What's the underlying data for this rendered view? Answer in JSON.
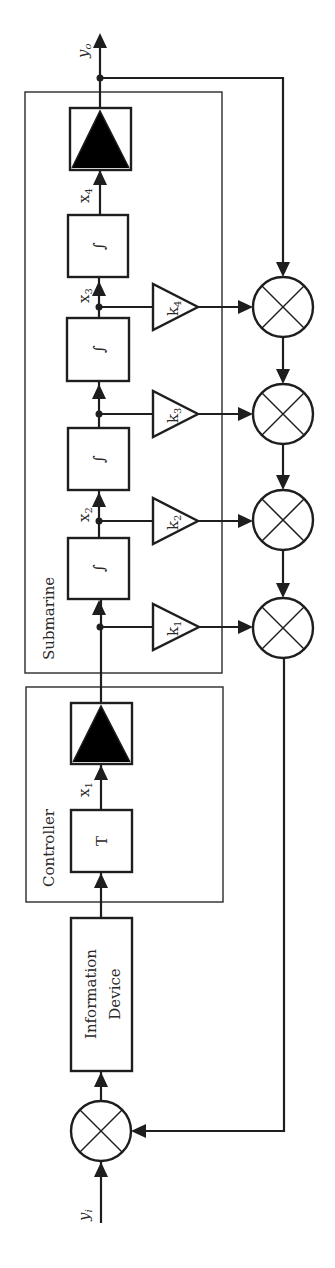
{
  "diagram": {
    "orientation": "rotated-90-ccw",
    "signals": {
      "input": {
        "base": "y",
        "sub": "i"
      },
      "output": {
        "base": "y",
        "sub": "o"
      },
      "x1": {
        "base": "x",
        "sub": "1"
      },
      "x2": {
        "base": "x",
        "sub": "2"
      },
      "x3": {
        "base": "x",
        "sub": "3"
      },
      "x4": {
        "base": "x",
        "sub": "4"
      }
    },
    "groups": {
      "controller": "Controller",
      "submarine": "Submarine"
    },
    "blocks": {
      "information_device_line1": "Information",
      "information_device_line2": "Device",
      "controller_T": "T",
      "integrator_symbol": "∫"
    },
    "gains": [
      {
        "base": "k",
        "sub": "1"
      },
      {
        "base": "k",
        "sub": "2"
      },
      {
        "base": "k",
        "sub": "3"
      },
      {
        "base": "k",
        "sub": "4"
      }
    ],
    "colors": {
      "line": "#1e1e1e",
      "background": "#ffffff"
    }
  }
}
